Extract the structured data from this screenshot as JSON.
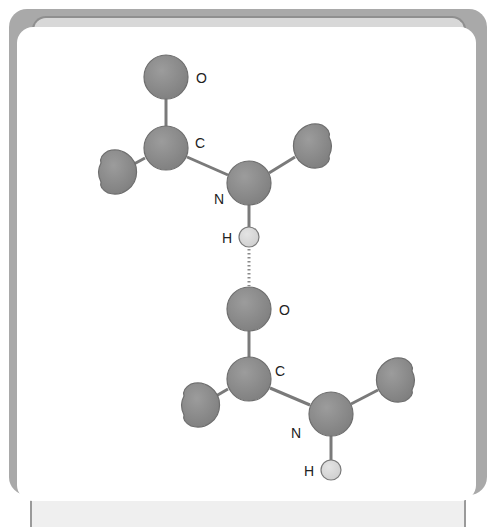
{
  "diagram": {
    "colors": {
      "atom_fill": "#8c8c8c",
      "atom_stroke": "#6e6e6e",
      "hydrogen_fill": "#d9d9d9",
      "hydrogen_stroke": "#7a7a7a",
      "bond": "#7a7a7a",
      "frame": "#a9a9a9",
      "card": "#ffffff"
    },
    "upper_molecule": {
      "atoms": [
        {
          "id": "O1",
          "label": "O",
          "x": 166,
          "y": 77,
          "r": 22
        },
        {
          "id": "C1",
          "label": "C",
          "x": 166,
          "y": 148,
          "r": 22
        },
        {
          "id": "N1",
          "label": "N",
          "x": 249,
          "y": 183,
          "r": 22
        },
        {
          "id": "H1",
          "label": "H",
          "x": 249,
          "y": 237,
          "r": 10
        }
      ],
      "partial_groups": [
        {
          "id": "R1a",
          "x": 118,
          "y": 172,
          "r": 22,
          "side": "left"
        },
        {
          "id": "R1b",
          "x": 312,
          "y": 146,
          "r": 22,
          "side": "right"
        }
      ]
    },
    "hydrogen_bond": {
      "from": "H1",
      "to": "O2",
      "style": "dotted"
    },
    "lower_molecule": {
      "atoms": [
        {
          "id": "O2",
          "label": "O",
          "x": 249,
          "y": 309,
          "r": 22
        },
        {
          "id": "C2",
          "label": "C",
          "x": 249,
          "y": 379,
          "r": 22
        },
        {
          "id": "N2",
          "label": "N",
          "x": 331,
          "y": 414,
          "r": 22
        },
        {
          "id": "H2",
          "label": "H",
          "x": 331,
          "y": 470,
          "r": 10
        }
      ],
      "partial_groups": [
        {
          "id": "R2a",
          "x": 201,
          "y": 405,
          "r": 22,
          "side": "left"
        },
        {
          "id": "R2b",
          "x": 395,
          "y": 380,
          "r": 22,
          "side": "right"
        }
      ]
    },
    "labels": {
      "o1": "O",
      "c1": "C",
      "n1": "N",
      "h1": "H",
      "o2": "O",
      "c2": "C",
      "n2": "N",
      "h2": "H"
    }
  }
}
